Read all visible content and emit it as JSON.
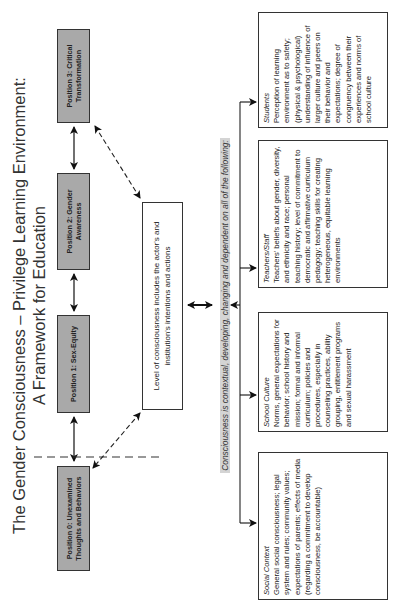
{
  "title": {
    "line1": "The Gender Consciousness – Privilege Learning Environment:",
    "line2": "A Framework for Education"
  },
  "positions": [
    {
      "label": "Position 0: Unexamined Thoughts and Behaviors"
    },
    {
      "label": "Position 1: Sex-Equity"
    },
    {
      "label": "Position 2: Gender Awareness"
    },
    {
      "label": "Position 3: Critical Transformation"
    }
  ],
  "level_box": {
    "text": "Level of consciousness includes the actor's and institution's intentions and actions"
  },
  "context_statement": "Consciousness is contextual, developing, changing and dependent on all of the following:",
  "factors": [
    {
      "heading": "Social Context",
      "body": "General social consciousness; legal system and rules; community values; expectations of parents; effects of media (regarding a commitment to develop consciousness, be accountable)"
    },
    {
      "heading": "School Culture",
      "body": "Norms, general expectations for behavior; school history and mission; formal and informal curriculum; policies and procedures, especially in counseling practices, ability grouping, entitlement programs and sexual harassment"
    },
    {
      "heading": "Teachers/Staff",
      "body": "Teachers' beliefs about gender, diversity, and ethnicity and race; personal teaching history; level of commitment to democratic and affirmative curriculum pedagogy; teaching skills for creating heterogeneous, equitable learning environments"
    },
    {
      "heading": "Students",
      "body": "Perception of learning environment as to safety; (physical & psychological) understanding of influence of larger culture and peers on their behavior and expectations; degree of congruency between their experiences and norms of school culture"
    }
  ],
  "colors": {
    "position_fill": "#a9a9a9",
    "border": "#333333",
    "context_highlight": "#d4d4d4"
  }
}
